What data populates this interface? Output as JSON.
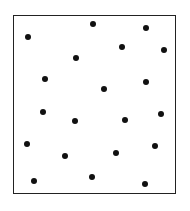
{
  "diagram": {
    "type": "dot-field",
    "frame": {
      "left": 13,
      "top": 15,
      "right": 176,
      "bottom": 194,
      "stroke": "#222222"
    },
    "dot_color": "#111111",
    "dots": [
      {
        "x": 93,
        "y": 24
      },
      {
        "x": 146,
        "y": 28
      },
      {
        "x": 28,
        "y": 37
      },
      {
        "x": 122,
        "y": 47
      },
      {
        "x": 164,
        "y": 50
      },
      {
        "x": 76,
        "y": 58
      },
      {
        "x": 45,
        "y": 79
      },
      {
        "x": 146,
        "y": 82
      },
      {
        "x": 104,
        "y": 89
      },
      {
        "x": 43,
        "y": 112
      },
      {
        "x": 161,
        "y": 114
      },
      {
        "x": 75,
        "y": 121
      },
      {
        "x": 125,
        "y": 120
      },
      {
        "x": 27,
        "y": 144
      },
      {
        "x": 155,
        "y": 146
      },
      {
        "x": 116,
        "y": 153
      },
      {
        "x": 65,
        "y": 156
      },
      {
        "x": 92,
        "y": 177
      },
      {
        "x": 34,
        "y": 181
      },
      {
        "x": 145,
        "y": 184
      }
    ]
  }
}
